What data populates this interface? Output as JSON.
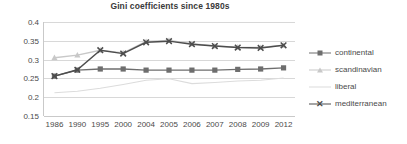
{
  "chart_data": {
    "type": "line",
    "title": "Gini coefficients  since 1980s",
    "xlabel": "",
    "ylabel": "",
    "categories": [
      "1986",
      "1990",
      "1995",
      "2000",
      "2004",
      "2005",
      "2006",
      "2007",
      "2008",
      "2009",
      "2012"
    ],
    "ylim": [
      0.15,
      0.4
    ],
    "yticks": [
      "0.4",
      "0.35",
      "0.3",
      "0.25",
      "0.2",
      "0.15"
    ],
    "ytick_values": [
      0.4,
      0.35,
      0.3,
      0.25,
      0.2,
      0.15
    ],
    "grid": true,
    "legend_position": "right",
    "series": [
      {
        "name": "continental",
        "color": "#6e6e6e",
        "marker": "square",
        "values": [
          0.256,
          0.272,
          0.275,
          0.275,
          0.272,
          0.272,
          0.272,
          0.272,
          0.274,
          0.275,
          0.278
        ]
      },
      {
        "name": "scandinavian",
        "color": "#c8c8c8",
        "marker": "triangle",
        "values": [
          0.305,
          0.312,
          0.325,
          0.318,
          0.348,
          0.351,
          0.342,
          0.336,
          0.333,
          0.332,
          0.338
        ]
      },
      {
        "name": "liberal",
        "color": "#dcdcdc",
        "marker": "none",
        "values": [
          0.212,
          0.216,
          0.224,
          0.234,
          0.245,
          0.249,
          0.236,
          0.239,
          0.243,
          0.245,
          0.251
        ]
      },
      {
        "name": "mediterranean",
        "color": "#4d4d4d",
        "marker": "x",
        "values": [
          0.256,
          0.273,
          0.325,
          0.316,
          0.346,
          0.349,
          0.341,
          0.336,
          0.332,
          0.331,
          0.338
        ]
      }
    ]
  },
  "legend": {
    "items": [
      {
        "label": "continental"
      },
      {
        "label": "scandinavian"
      },
      {
        "label": "liberal"
      },
      {
        "label": "mediterranean"
      }
    ]
  }
}
